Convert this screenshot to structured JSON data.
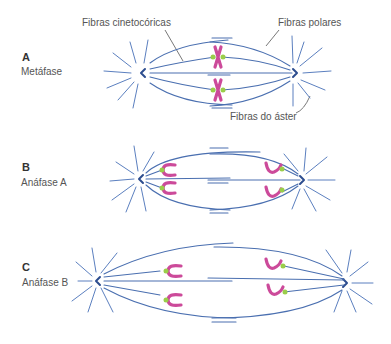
{
  "figure": {
    "labels": {
      "kinetochore_fibers": "Fibras cinetocóricas",
      "polar_fibers": "Fibras polares",
      "aster_fibers": "Fibras do áster"
    },
    "panels": [
      {
        "letter": "A",
        "stage": "Metáfase"
      },
      {
        "letter": "B",
        "stage": "Anáfase A"
      },
      {
        "letter": "C",
        "stage": "Anáfase B"
      }
    ],
    "colors": {
      "fibers": "#4a6fb0",
      "centrosome": "#2d4d8f",
      "chromosome": "#cc4a9a",
      "kinetochore": "#9acd4a",
      "label_text": "#555555"
    }
  }
}
